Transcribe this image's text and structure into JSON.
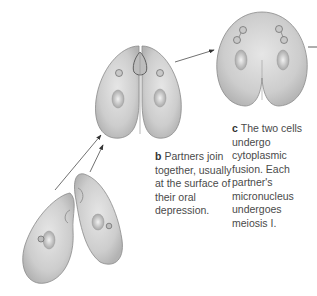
{
  "diagram": {
    "stages": [
      {
        "id": "a",
        "description": "two separate cells approaching"
      },
      {
        "id": "b",
        "letter": "b",
        "caption": "Partners join together, usually at the surface of their oral depression."
      },
      {
        "id": "c",
        "letter": "c",
        "caption": "The two cells undergo cytoplasmic fusion. Each partner's micronucleus undergoes meiosis I."
      }
    ],
    "colors": {
      "cell_fill": "#cfcfcf",
      "cell_edge": "#8a8a8a",
      "text": "#4a4a4a",
      "arrow": "#333333"
    }
  }
}
